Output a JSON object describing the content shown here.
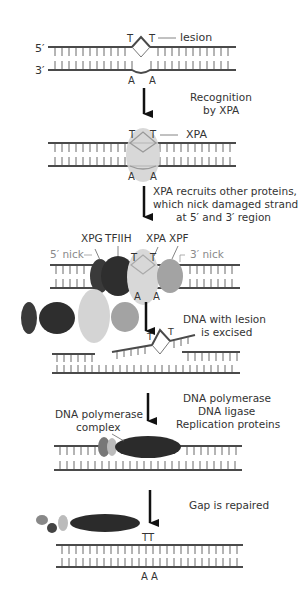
{
  "colors": {
    "strand": "#4a4a4a",
    "text": "#333333",
    "nick_label": "#8a8a8a",
    "xpa": "#d4d4d4",
    "xpg": "#3a3a3a",
    "tfiih": "#2e2e2e",
    "xpf": "#a3a3a3",
    "polymerase": "#2b2b2b"
  },
  "step1": {
    "label_5prime": "5′",
    "label_3prime": "3′",
    "base_t1": "T",
    "base_t2": "T",
    "base_a1": "A",
    "base_a2": "A",
    "lesion_label": "lesion"
  },
  "step2": {
    "caption_line1": "Recognition",
    "caption_line2": "by XPA",
    "base_t1": "T",
    "base_t2": "T",
    "base_a1": "A",
    "base_a2": "A",
    "xpa_label": "XPA"
  },
  "step3": {
    "caption_line1": "XPA recruits other proteins,",
    "caption_line2": "which nick damaged strand",
    "caption_line3": "at 5′ and 3′ region",
    "xpg_label": "XPG",
    "tfiih_label": "TFIIH",
    "xpa_label": "XPA",
    "xpf_label": "XPF",
    "nick5_label": "5′ nick",
    "nick3_label": "3′ nick",
    "base_t1": "T",
    "base_t2": "T",
    "base_a1": "A",
    "base_a2": "A"
  },
  "step4": {
    "caption_line1": "DNA with lesion",
    "caption_line2": "is excised",
    "base_t1": "T",
    "base_t2": "T"
  },
  "step5": {
    "caption_line1": "DNA polymerase",
    "caption_line2": "DNA ligase",
    "caption_line3": "Replication proteins",
    "complex_label_line1": "DNA polymerase",
    "complex_label_line2": "complex"
  },
  "step6": {
    "caption": "Gap is repaired",
    "base_tt": "TT",
    "base_aa": "A A"
  }
}
